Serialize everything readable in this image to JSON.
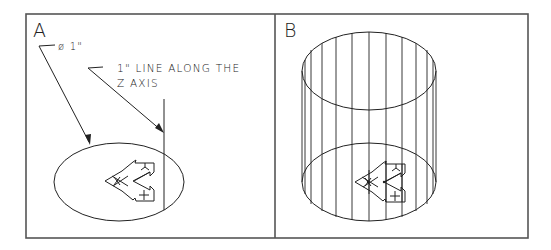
{
  "figure": {
    "panels": [
      {
        "id": "A",
        "label": "A",
        "annotations": {
          "diameter": "ø 1\"",
          "line_note_1": "1\" LINE ALONG THE",
          "line_note_2": "Z AXIS"
        },
        "content": "circle with UCS icon and 1-inch vertical line along Z axis"
      },
      {
        "id": "B",
        "label": "B",
        "content": "wireframe cylinder extruded from circle along Z axis, UCS icon at base"
      }
    ],
    "colors": {
      "line": "#222222",
      "frame": "#555555",
      "background": "#ffffff"
    }
  }
}
